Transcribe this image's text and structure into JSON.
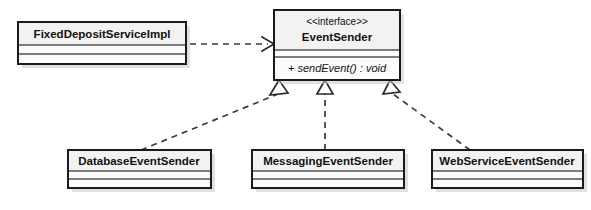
{
  "diagram": {
    "kind": "uml-class-diagram",
    "colors": {
      "border": "#1a1a1a",
      "divider": "#555555",
      "box_fill": "#fbfbfb",
      "title_fill": "#f2f2f2",
      "shadow": "#c9c9c9",
      "edge": "#3a3a3a",
      "text": "#111111"
    }
  },
  "classes": {
    "fixed_deposit_service_impl": {
      "name": "FixedDepositServiceImpl",
      "stereotype": "",
      "attributes": [],
      "operations": []
    },
    "event_sender": {
      "name": "EventSender",
      "stereotype": "<<interface>>",
      "attributes": [],
      "operations": [
        "+ sendEvent() : void"
      ]
    },
    "database_event_sender": {
      "name": "DatabaseEventSender",
      "stereotype": "",
      "attributes": [],
      "operations": []
    },
    "messaging_event_sender": {
      "name": "MessagingEventSender",
      "stereotype": "",
      "attributes": [],
      "operations": []
    },
    "web_service_event_sender": {
      "name": "WebServiceEventSender",
      "stereotype": "",
      "attributes": [],
      "operations": []
    }
  },
  "relationships": [
    {
      "id": "dependency-impl-to-interface",
      "type": "dependency",
      "line": "dashed",
      "arrowhead": "open",
      "source": "FixedDepositServiceImpl",
      "target": "EventSender",
      "label": ""
    },
    {
      "id": "realization-database",
      "type": "realization",
      "line": "dashed",
      "arrowhead": "hollow-triangle",
      "source": "DatabaseEventSender",
      "target": "EventSender",
      "label": ""
    },
    {
      "id": "realization-messaging",
      "type": "realization",
      "line": "dashed",
      "arrowhead": "hollow-triangle",
      "source": "MessagingEventSender",
      "target": "EventSender",
      "label": ""
    },
    {
      "id": "realization-webservice",
      "type": "realization",
      "line": "dashed",
      "arrowhead": "hollow-triangle",
      "source": "WebServiceEventSender",
      "target": "EventSender",
      "label": ""
    }
  ]
}
